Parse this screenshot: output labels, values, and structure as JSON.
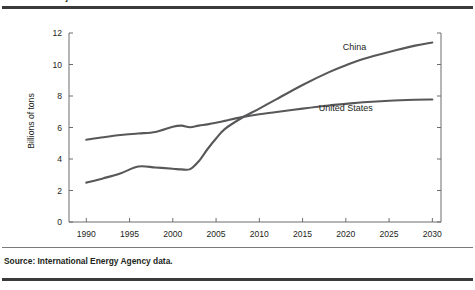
{
  "figure": {
    "title": "FIGURE 1-1  Projected Oil and Carbon Emissions Growth in China and the United States",
    "source": "Source: International Energy Agency data."
  },
  "chart_data": {
    "type": "line",
    "title": "",
    "xlabel": "",
    "ylabel": "Billions of tons",
    "xlim": [
      1988,
      2031
    ],
    "ylim": [
      0,
      12
    ],
    "grid": false,
    "legend_position": "inline-annotations",
    "xticks": [
      1990,
      1995,
      2000,
      2005,
      2010,
      2015,
      2020,
      2025,
      2030
    ],
    "yticks": [
      0,
      2,
      4,
      6,
      8,
      10,
      12
    ],
    "x": [
      1990,
      1992,
      1994,
      1996,
      1998,
      2000,
      2001,
      2002,
      2003,
      2004,
      2005,
      2006,
      2008,
      2010,
      2012,
      2015,
      2018,
      2020,
      2022,
      2025,
      2028,
      2030
    ],
    "series": [
      {
        "name": "United States",
        "color": "#58585b",
        "values": [
          5.22,
          5.38,
          5.52,
          5.62,
          5.72,
          6.05,
          6.12,
          6.02,
          6.12,
          6.2,
          6.3,
          6.42,
          6.66,
          6.84,
          6.98,
          7.2,
          7.4,
          7.5,
          7.6,
          7.7,
          7.76,
          7.78
        ]
      },
      {
        "name": "China",
        "color": "#58585b",
        "values": [
          2.5,
          2.78,
          3.1,
          3.52,
          3.46,
          3.38,
          3.34,
          3.36,
          3.86,
          4.62,
          5.3,
          5.9,
          6.62,
          7.2,
          7.8,
          8.7,
          9.5,
          9.95,
          10.35,
          10.8,
          11.2,
          11.4
        ]
      }
    ],
    "annotations": [
      {
        "text": "China",
        "x": 2021,
        "y": 10.95
      },
      {
        "text": "United States",
        "x": 2020,
        "y": 7.05
      }
    ]
  }
}
